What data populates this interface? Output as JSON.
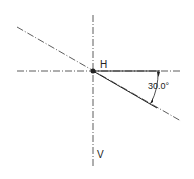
{
  "diagram": {
    "labels": {
      "horizontal_axis": "H",
      "vertical_axis": "V",
      "angle": "30.0°"
    },
    "angle_degrees": 30.0,
    "colors": {
      "line": "#222222",
      "background": "#ffffff"
    }
  }
}
